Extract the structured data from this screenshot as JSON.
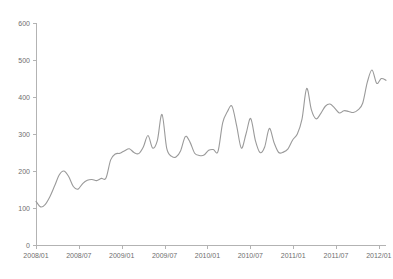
{
  "chart_data": {
    "type": "line",
    "title": "",
    "subtitle": "",
    "xlabel": "",
    "ylabel": "",
    "grid": false,
    "legend": false,
    "legend_position": "none",
    "line_color": "#9a9a9a",
    "axis_color": "#b3b3b3",
    "label_color": "#6e6e6e",
    "background_color": "#ffffff",
    "ylim": [
      0,
      600
    ],
    "y_ticks": [
      0,
      100,
      200,
      300,
      400,
      500,
      600
    ],
    "y_tick_labels": [
      "0",
      "100",
      "200",
      "300",
      "400",
      "500",
      "600"
    ],
    "x_tick_labels": [
      "2008/01",
      "2008/07",
      "2009/01",
      "2009/07",
      "2010/01",
      "2010/07",
      "2011/01",
      "2011/07",
      "2012/01"
    ],
    "x_tick_indices": [
      0,
      6,
      12,
      18,
      24,
      30,
      36,
      42,
      48
    ],
    "xlim_index": [
      0,
      49
    ],
    "x": [
      "2008/01",
      "2008/02",
      "2008/03",
      "2008/04",
      "2008/05",
      "2008/06",
      "2008/07",
      "2008/08",
      "2008/09",
      "2008/10",
      "2008/11",
      "2008/12",
      "2009/01",
      "2009/02",
      "2009/03",
      "2009/04",
      "2009/05",
      "2009/06",
      "2009/07",
      "2009/08",
      "2009/09",
      "2009/10",
      "2009/11",
      "2009/12",
      "2010/01",
      "2010/02",
      "2010/03",
      "2010/04",
      "2010/05",
      "2010/06",
      "2010/07",
      "2010/08",
      "2010/09",
      "2010/10",
      "2010/11",
      "2010/12",
      "2011/01",
      "2011/02",
      "2011/03",
      "2011/04",
      "2011/05",
      "2011/06",
      "2011/07",
      "2011/08",
      "2011/09",
      "2011/10",
      "2011/11",
      "2011/12",
      "2012/01",
      "2012/02"
    ],
    "series": [
      {
        "name": "value",
        "values": [
          118,
          103,
          110,
          131,
          160,
          190,
          200,
          185,
          158,
          151,
          166,
          175,
          177,
          174,
          180,
          181,
          230,
          246,
          248,
          255,
          260,
          250,
          247,
          265,
          296,
          262,
          282,
          353,
          262,
          240,
          238,
          255,
          293,
          278,
          248,
          242,
          243,
          256,
          258,
          253,
          330,
          360,
          375,
          322,
          262,
          300,
          342,
          283,
          250,
          265
        ]
      }
    ],
    "extra_values_tail": [
      315,
      277,
      250,
      251,
      260,
      284,
      300,
      340,
      423,
      366,
      341,
      355,
      375,
      381,
      370,
      357,
      363,
      361,
      358,
      365,
      383,
      440,
      473,
      437,
      450,
      445
    ]
  }
}
